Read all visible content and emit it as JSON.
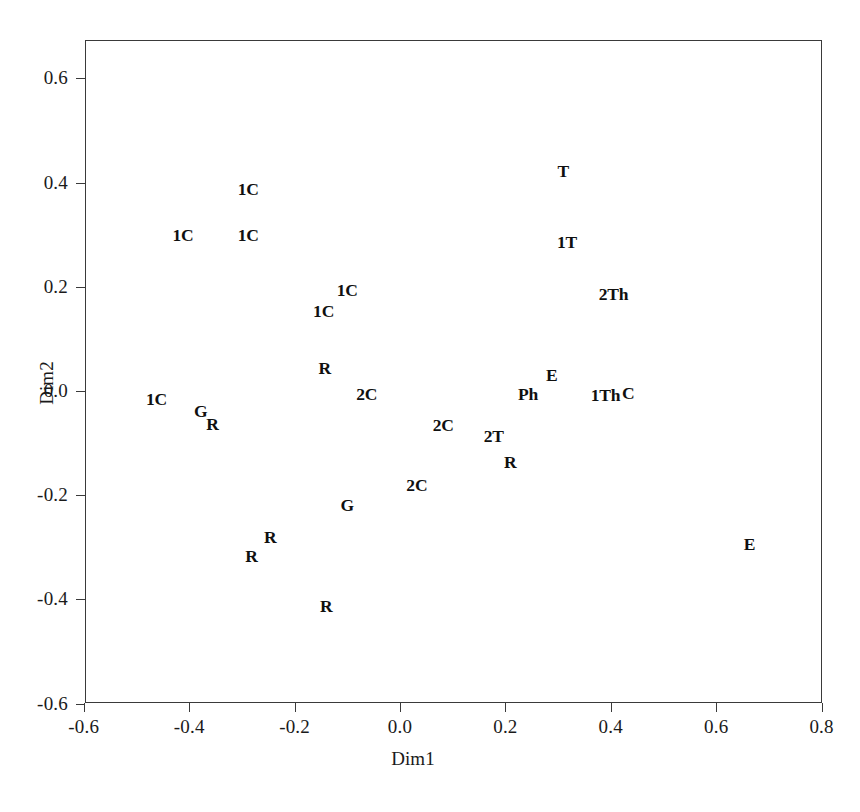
{
  "chart_data": {
    "type": "scatter",
    "title": "",
    "xlabel": "Dim1",
    "ylabel": "Dim2",
    "xlim": [
      -0.6,
      0.8
    ],
    "ylim": [
      -0.6,
      0.6
    ],
    "xticks": [
      "-0.6",
      "-0.4",
      "-0.2",
      "0.0",
      "0.2",
      "0.4",
      "0.6",
      "0.8"
    ],
    "xtick_values": [
      -0.6,
      -0.4,
      -0.2,
      0.0,
      0.2,
      0.4,
      0.6,
      0.8
    ],
    "yticks": [
      "0.6",
      "0.4",
      "0.2",
      "0.0",
      "-0.2",
      "-0.4",
      "-0.6"
    ],
    "ytick_values": [
      0.6,
      0.4,
      0.2,
      0.0,
      -0.2,
      -0.4,
      -0.6
    ],
    "grid": false,
    "legend": null,
    "marker_style": "text-label",
    "points": [
      {
        "label": "1C",
        "x": -0.288,
        "y": 0.385
      },
      {
        "label": "1C",
        "x": -0.412,
        "y": 0.298
      },
      {
        "label": "1C",
        "x": -0.288,
        "y": 0.298
      },
      {
        "label": "1C",
        "x": -0.1,
        "y": 0.192
      },
      {
        "label": "1C",
        "x": -0.145,
        "y": 0.152
      },
      {
        "label": "R",
        "x": -0.143,
        "y": 0.043
      },
      {
        "label": "2C",
        "x": -0.063,
        "y": -0.008
      },
      {
        "label": "1C",
        "x": -0.462,
        "y": -0.018
      },
      {
        "label": "G",
        "x": -0.378,
        "y": -0.04
      },
      {
        "label": "R",
        "x": -0.356,
        "y": -0.066
      },
      {
        "label": "2C",
        "x": 0.082,
        "y": -0.067
      },
      {
        "label": "2T",
        "x": 0.178,
        "y": -0.089
      },
      {
        "label": "R",
        "x": 0.209,
        "y": -0.138
      },
      {
        "label": "2C",
        "x": 0.032,
        "y": -0.183
      },
      {
        "label": "G",
        "x": -0.1,
        "y": -0.22
      },
      {
        "label": "R",
        "x": -0.246,
        "y": -0.283
      },
      {
        "label": "R",
        "x": -0.282,
        "y": -0.318
      },
      {
        "label": "R",
        "x": -0.14,
        "y": -0.415
      },
      {
        "label": "T",
        "x": 0.31,
        "y": 0.42
      },
      {
        "label": "1T",
        "x": 0.317,
        "y": 0.285
      },
      {
        "label": "2Th",
        "x": 0.405,
        "y": 0.185
      },
      {
        "label": "E",
        "x": 0.288,
        "y": 0.028
      },
      {
        "label": "Ph",
        "x": 0.243,
        "y": -0.008
      },
      {
        "label": "1Th",
        "x": 0.39,
        "y": -0.01
      },
      {
        "label": "C",
        "x": 0.433,
        "y": -0.006
      },
      {
        "label": "E",
        "x": 0.663,
        "y": -0.295
      }
    ]
  }
}
